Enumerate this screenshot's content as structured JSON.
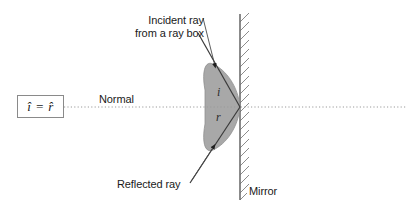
{
  "figure": {
    "type": "physics-ray-diagram",
    "background_color": "#ffffff"
  },
  "formula": {
    "text": "î = r̂",
    "box_border_color": "#8a8a8a"
  },
  "labels": {
    "normal": "Normal",
    "mirror": "Mirror",
    "incident_line1": "Incident ray",
    "incident_line2": "from a ray box",
    "reflected": "Reflected ray"
  },
  "angles": {
    "incidence": "i",
    "reflection": "r"
  },
  "colors": {
    "wedge_fill": "#a8a8a8",
    "wedge_stroke": "#8f8f8f",
    "ray_stroke": "#3a3a3a",
    "mirror_stroke": "#6e6e6e",
    "hatch_stroke": "#8c8c8c",
    "normal_dotted": "#9a9a9a",
    "text": "#1a1a1a"
  },
  "geometry": {
    "mirror_x": 240,
    "mirror_top_y": 14,
    "mirror_bottom_y": 200,
    "normal_y": 107,
    "normal_start_x": 64,
    "normal_end_x": 406,
    "reflection_point": [
      240,
      107
    ],
    "incident_ray_start": [
      198,
      33
    ],
    "reflected_ray_end": [
      190,
      183
    ],
    "wedge_left_vertex_x": 205
  }
}
